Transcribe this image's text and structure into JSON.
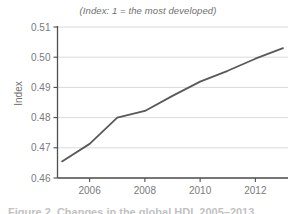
{
  "chart_data": {
    "type": "line",
    "title": "(Index: 1 = the most developed)",
    "subtitle": "",
    "xlabel": "",
    "ylabel": "Index",
    "x": [
      2005,
      2006,
      2007,
      2008,
      2009,
      2010,
      2011,
      2012,
      2013
    ],
    "series": [
      {
        "name": "Index",
        "values": [
          0.4655,
          0.4713,
          0.48,
          0.4822,
          0.4872,
          0.4919,
          0.4955,
          0.4995,
          0.503
        ],
        "color": "#595959"
      }
    ],
    "xlim": [
      2005,
      2013
    ],
    "ylim": [
      0.46,
      0.51
    ],
    "xticks": [
      2006,
      2008,
      2010,
      2012
    ],
    "xtick_labels": [
      "2006",
      "2008",
      "2010",
      "2012"
    ],
    "yticks": [
      0.46,
      0.47,
      0.48,
      0.49,
      0.5,
      0.51
    ],
    "ytick_labels": [
      "0.46",
      "0.47",
      "0.48",
      "0.49",
      "0.50",
      "0.51"
    ],
    "grid": "horizontal",
    "grid_color": "#d9d9d9",
    "axis_color": "#4f4f4f",
    "legend": "none",
    "legend_position": "none",
    "annotations": []
  },
  "caption": {
    "text": "Figure 2. Changes in the global HDI, 2005–2013"
  },
  "axes": {
    "y_title": "Index"
  }
}
